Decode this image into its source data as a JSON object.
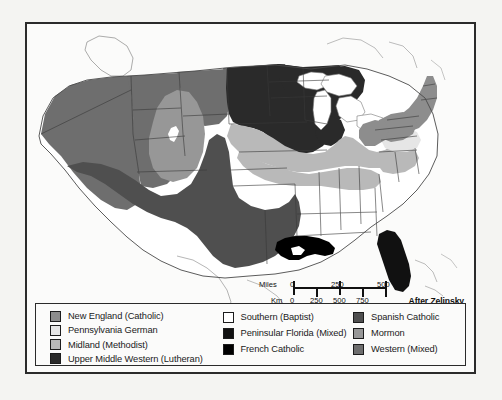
{
  "figure": {
    "credit": "After Zelinsky",
    "background_color": "#f4f4f2",
    "frame_color": "#2b2b2b"
  },
  "scalebar": {
    "miles_label": "Miles",
    "km_label": "Km",
    "miles_ticks": [
      "0",
      "250",
      "500"
    ],
    "km_ticks": [
      "0",
      "250",
      "500",
      "750"
    ]
  },
  "legend": {
    "columns": [
      {
        "items": [
          {
            "label": "New England (Catholic)",
            "color": "#8d8d8d"
          },
          {
            "label": "Pennsylvania German",
            "color": "#e6e6e6"
          },
          {
            "label": "Midland (Methodist)",
            "color": "#b9b9b9"
          },
          {
            "label": "Upper Middle Western (Lutheran)",
            "color": "#2a2a2a"
          }
        ]
      },
      {
        "items": [
          {
            "label": "Southern (Baptist)",
            "color": "#ffffff"
          },
          {
            "label": "Peninsular Florida (Mixed)",
            "color": "#111111"
          },
          {
            "label": "French Catholic",
            "color": "#000000"
          }
        ]
      },
      {
        "items": [
          {
            "label": "Spanish Catholic",
            "color": "#4f4f4f"
          },
          {
            "label": "Mormon",
            "color": "#979797"
          },
          {
            "label": "Western (Mixed)",
            "color": "#6e6e6e"
          }
        ]
      }
    ]
  },
  "map": {
    "regions": [
      {
        "name": "western-mixed",
        "color": "#6e6e6e"
      },
      {
        "name": "mormon",
        "color": "#979797"
      },
      {
        "name": "spanish-catholic",
        "color": "#4f4f4f"
      },
      {
        "name": "upper-middle-western-lutheran",
        "color": "#2a2a2a"
      },
      {
        "name": "midland-methodist",
        "color": "#b9b9b9"
      },
      {
        "name": "new-england-catholic",
        "color": "#8d8d8d"
      },
      {
        "name": "pennsylvania-german",
        "color": "#e6e6e6"
      },
      {
        "name": "southern-baptist",
        "color": "#ffffff"
      },
      {
        "name": "french-catholic",
        "color": "#000000"
      },
      {
        "name": "peninsular-florida-mixed",
        "color": "#111111"
      }
    ],
    "water_color": "#ffffff",
    "outline_color": "#4a4a4a",
    "border_color": "#3a3a3a"
  }
}
